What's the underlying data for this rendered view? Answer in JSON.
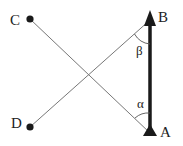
{
  "diagram": {
    "type": "geometry",
    "points": {
      "A": {
        "label": "A",
        "x": 150,
        "y": 135
      },
      "B": {
        "label": "B",
        "x": 150,
        "y": 12
      },
      "C": {
        "label": "C",
        "x": 30,
        "y": 19
      },
      "D": {
        "label": "D",
        "x": 30,
        "y": 127
      }
    },
    "angles": {
      "alpha": {
        "label": "α",
        "vertex": "A"
      },
      "beta": {
        "label": "β",
        "vertex": "B"
      }
    },
    "colors": {
      "rod": "#1a1a1a",
      "thin_line": "#777777",
      "dot": "#1a1a1a",
      "text": "#222222"
    }
  }
}
